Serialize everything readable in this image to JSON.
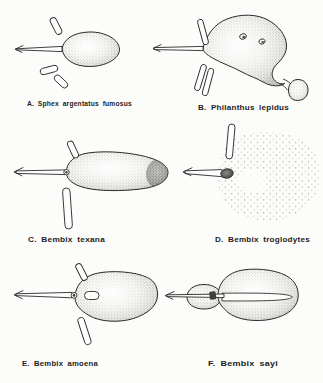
{
  "figure": {
    "paper_color": "#fcfcfb",
    "ink_color": "#2a2a2a",
    "panels": [
      {
        "id": "A",
        "label": "A. Sphex argentatus fumosus",
        "drawing": "leftward-arrow-burrow-large-oval-cell-three-cocoons"
      },
      {
        "id": "B",
        "label": "B. Philanthus lepidus",
        "drawing": "leftward-arrow-burrow-irregular-mound-two-top-holes-three-spur-tubes-small-side-cell"
      },
      {
        "id": "C",
        "label": "C. Bembix texana",
        "drawing": "leftward-arrow-burrow-tapered-cell-dark-tip-cocoon-above-long-tube-below"
      },
      {
        "id": "D",
        "label": "D. Bembix troglodytes",
        "drawing": "short-leftward-arrow-burrow-dark-end-cell-vertical-tube-scattered-sand-dots"
      },
      {
        "id": "E",
        "label": "E. Bembix amoena",
        "drawing": "leftward-arrow-burrow-oval-cell-inner-capsule-two-cocoons"
      },
      {
        "id": "F",
        "label": "F. Bembix sayi",
        "drawing": "leftward-arrow-through-small-mound-large-cell-long-inner-tunnel"
      }
    ]
  }
}
